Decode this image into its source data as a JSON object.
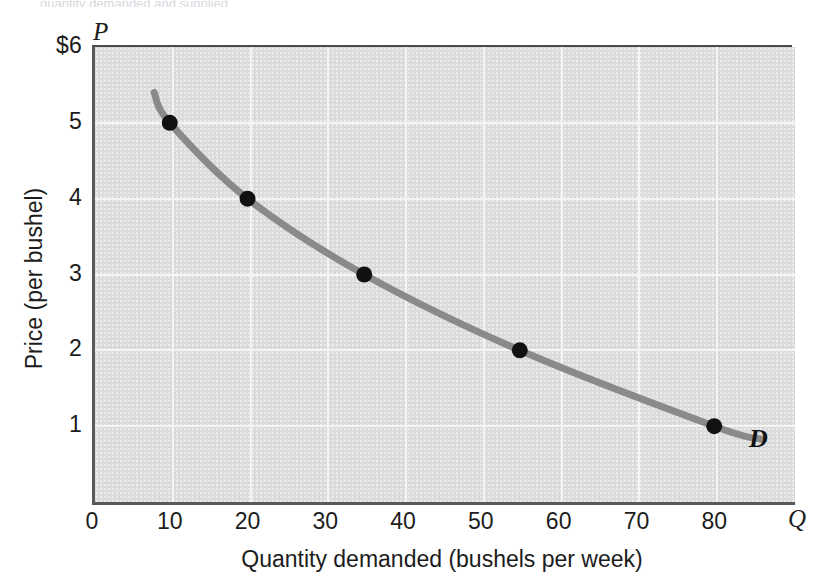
{
  "figure": {
    "top_crop_artifact": "quantity demanded and supplied",
    "axis_letter_price": "P",
    "axis_letter_quantity": "Q",
    "curve_label": "D",
    "panel_color": "#dcdcdc",
    "gridline_color": "#f4f4f4",
    "curve_color": "#8a8a8a",
    "point_color": "#111111",
    "axis_color": "#59595c"
  },
  "chart_data": {
    "type": "line",
    "title": "",
    "subtitle": "",
    "xlabel": "Quantity demanded (bushels per week)",
    "ylabel": "Price (per bushel)",
    "xlim": [
      0,
      90
    ],
    "ylim": [
      0,
      6
    ],
    "grid": true,
    "legend_position": "none",
    "x_ticks": [
      "0",
      "10",
      "20",
      "30",
      "40",
      "50",
      "60",
      "70",
      "80"
    ],
    "x_tick_values": [
      0,
      10,
      20,
      30,
      40,
      50,
      60,
      70,
      80
    ],
    "y_ticks": [
      "$6",
      "5",
      "4",
      "3",
      "2",
      "1"
    ],
    "y_tick_values": [
      6,
      5,
      4,
      3,
      2,
      1
    ],
    "series": [
      {
        "name": "D",
        "label": "D",
        "color": "#8a8a8a",
        "marker": "circle",
        "x": [
          10,
          20,
          35,
          55,
          80
        ],
        "y": [
          5,
          4,
          3,
          2,
          1
        ],
        "points": [
          {
            "quantity": 10,
            "price": 5
          },
          {
            "quantity": 20,
            "price": 4
          },
          {
            "quantity": 35,
            "price": 3
          },
          {
            "quantity": 55,
            "price": 2
          },
          {
            "quantity": 80,
            "price": 1
          }
        ],
        "curve_extends_from": {
          "quantity": 8,
          "price": 5.4
        },
        "curve_extends_to": {
          "quantity": 86,
          "price": 0.83
        }
      }
    ],
    "annotations": [
      {
        "text": "D",
        "quantity": 85,
        "price": 1.05,
        "style": "bold-italic"
      },
      {
        "text": "P",
        "position": "y-axis-top"
      },
      {
        "text": "Q",
        "position": "x-axis-right"
      }
    ]
  }
}
